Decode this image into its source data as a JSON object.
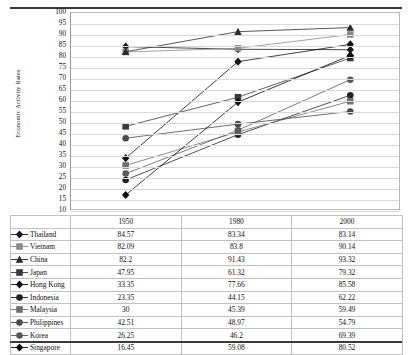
{
  "chart_data": {
    "type": "line",
    "title": "",
    "xlabel": "",
    "ylabel": "Economic Activity Rates",
    "categories": [
      "1950",
      "1980",
      "2000"
    ],
    "ylim": [
      10,
      100
    ],
    "y_ticks": [
      100,
      95,
      90,
      85,
      80,
      75,
      70,
      65,
      60,
      55,
      50,
      45,
      40,
      35,
      30,
      25,
      20,
      15,
      10
    ],
    "grid": true,
    "legend_position": "table-below",
    "series": [
      {
        "name": "Thailand",
        "marker": "diamond",
        "color": "#1a1a1a",
        "values": [
          84.57,
          83.34,
          83.14
        ]
      },
      {
        "name": "Vietnam",
        "marker": "square",
        "color": "#8a8a8a",
        "values": [
          82.09,
          83.8,
          90.14
        ]
      },
      {
        "name": "China",
        "marker": "triangle",
        "color": "#2b2b2b",
        "values": [
          82.2,
          91.43,
          93.32
        ]
      },
      {
        "name": "Japan",
        "marker": "square",
        "color": "#3a3a3a",
        "values": [
          47.95,
          61.32,
          79.32
        ]
      },
      {
        "name": "Hong Kong",
        "marker": "diamond",
        "color": "#111111",
        "values": [
          33.35,
          77.66,
          85.58
        ]
      },
      {
        "name": "Indonesia",
        "marker": "circle",
        "color": "#222222",
        "values": [
          23.35,
          44.15,
          62.22
        ]
      },
      {
        "name": "Malaysia",
        "marker": "square",
        "color": "#6e6e6e",
        "values": [
          30,
          45.39,
          59.49
        ]
      },
      {
        "name": "Philippines",
        "marker": "circle",
        "color": "#4a4a4a",
        "values": [
          42.51,
          48.97,
          54.79
        ]
      },
      {
        "name": "Korea",
        "marker": "circle",
        "color": "#5a5a5a",
        "values": [
          26.25,
          46.2,
          69.39
        ]
      },
      {
        "name": "Singapore",
        "marker": "diamond",
        "color": "#0d0d0d",
        "values": [
          16.45,
          59.08,
          80.52
        ]
      }
    ]
  },
  "table": {
    "blank_header": "",
    "headers": [
      "1950",
      "1980",
      "2000"
    ],
    "rows": [
      {
        "label": "Thailand",
        "v": [
          "84.57",
          "83.34",
          "83.14"
        ]
      },
      {
        "label": "Vietnam",
        "v": [
          "82.09",
          "83.8",
          "90.14"
        ]
      },
      {
        "label": "China",
        "v": [
          "82.2",
          "91.43",
          "93.32"
        ]
      },
      {
        "label": "Japan",
        "v": [
          "47.95",
          "61.32",
          "79.32"
        ]
      },
      {
        "label": "Hong Kong",
        "v": [
          "33.35",
          "77.66",
          "85.58"
        ]
      },
      {
        "label": "Indonesia",
        "v": [
          "23.35",
          "44.15",
          "62.22"
        ]
      },
      {
        "label": "Malaysia",
        "v": [
          "30",
          "45.39",
          "59.49"
        ]
      },
      {
        "label": "Philippines",
        "v": [
          "42.51",
          "48.97",
          "54.79"
        ]
      },
      {
        "label": "Korea",
        "v": [
          "26.25",
          "46.2",
          "69.39"
        ]
      },
      {
        "label": "Singapore",
        "v": [
          "16.45",
          "59.08",
          "80.52"
        ]
      }
    ]
  },
  "axis": {
    "y_title": "Economic Activity Rates"
  }
}
